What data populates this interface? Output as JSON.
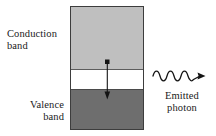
{
  "figure": {
    "type": "semiconductor-band-diagram",
    "background_color": "#ffffff"
  },
  "bands": {
    "conduction": {
      "name": "conduction-band",
      "label_line1": "Conduction",
      "label_line2": "band",
      "fill_color": "#bfbfbf"
    },
    "gap": {
      "name": "band-gap",
      "fill_color": "#ffffff"
    },
    "valence": {
      "name": "valence-band",
      "label_line1": "Valence",
      "label_line2": "band",
      "fill_color": "#6e6e6e"
    },
    "outline_color": "#3d3d3d"
  },
  "transition": {
    "name": "electron-transition-arrow",
    "direction": "downward",
    "start_marker": "filled-square-dot",
    "end_marker": "filled-arrowhead",
    "stroke_color": "#1a1a1a"
  },
  "photon": {
    "name": "emitted-photon-wave",
    "label_line1": "Emitted",
    "label_line2": "photon",
    "wave_cycles": 4,
    "direction": "rightward",
    "stroke_color": "#1a1a1a"
  }
}
